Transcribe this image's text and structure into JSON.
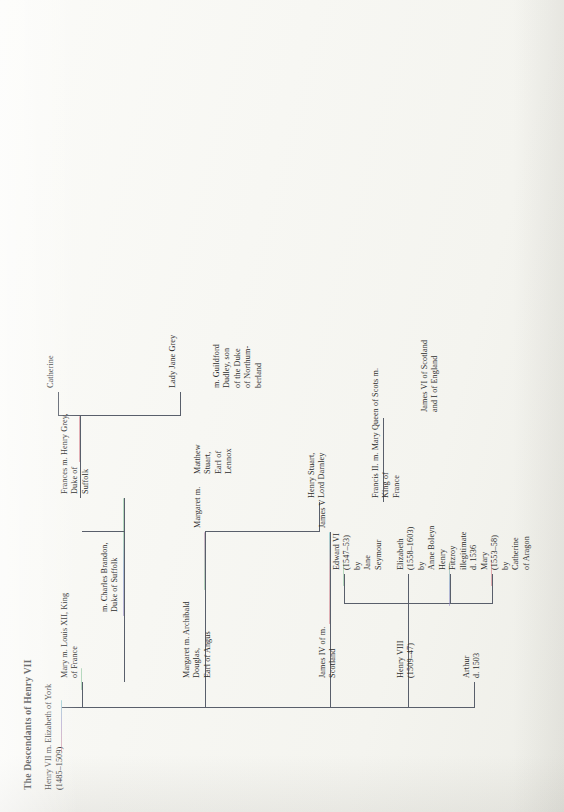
{
  "document": {
    "title": "The Descendants of Henry VII",
    "root": "Henry VII m. Elizabeth of York\n(1485–1509)"
  },
  "colors": {
    "ink": "#2c2c2c",
    "rule": "#595f6b",
    "paper": "#f6f6f1",
    "tint_red": "#d2737f",
    "tint_green": "#7fbf93",
    "tint_blue": "#6f8fc4",
    "tint_violet": "#8f7fbf"
  },
  "generations": [
    {
      "name": "children-of-henry-vii",
      "nodes": [
        {
          "id": "arthur",
          "text": "Arthur\nd. 1503"
        },
        {
          "id": "henry-viii",
          "text": "Henry VIII\n(1509–47)"
        },
        {
          "id": "james-iv",
          "text": "James IV of m.\nScotland"
        },
        {
          "id": "margaret-1",
          "text": "Margaret m.  Archibald\nDouglas,\nEarl of Angus"
        },
        {
          "id": "mary-tudor",
          "text": "Mary m.  Louis XII, King\nof France"
        }
      ]
    },
    {
      "name": "generation-3",
      "nodes": [
        {
          "id": "mary-i",
          "text": "Mary\n(1553–58)\nby\nCatherine\nof Aragon"
        },
        {
          "id": "henry-fitzroy",
          "text": "Henry\nFitzroy\nillegitimate\nd. 1536"
        },
        {
          "id": "elizabeth-i",
          "text": "Elizabeth\n(1558–1603)\nby\nAnne Boleyn"
        },
        {
          "id": "edward-vi",
          "text": "Edward VI\n(1547–53)\nby\nJane\nSeymour"
        },
        {
          "id": "james-v",
          "text": "James V"
        },
        {
          "id": "margaret-2",
          "text": "Margaret m."
        },
        {
          "id": "matthew-stuart",
          "text": "Matthew\nStuart,\nEarl of\nLennox"
        },
        {
          "id": "charles-brandon",
          "text": "m. Charles Brandon,\nDuke of Suffolk"
        }
      ]
    },
    {
      "name": "generation-4",
      "nodes": [
        {
          "id": "francis-ii",
          "text": "Francis II. m. Mary Queen of Scots m.\nKing of\nFrance"
        },
        {
          "id": "henry-darnley",
          "text": "Henry Stuart,\nLord Darnley"
        },
        {
          "id": "frances-grey",
          "text": "Frances m.  Henry Grey,\nDuke of\nSuffolk"
        }
      ]
    },
    {
      "name": "generation-5",
      "nodes": [
        {
          "id": "james-vi",
          "text": "James VI of Scotland\nand I of England"
        },
        {
          "id": "lady-jane-grey",
          "text": "Lady Jane Grey"
        },
        {
          "id": "guildford",
          "text": "m. Guildford\nDudley, son\nof the Duke\nof Northum-\nberland"
        },
        {
          "id": "catherine",
          "text": "Catherine"
        }
      ]
    }
  ],
  "labels": {
    "arthur": "Arthur\nd. 1503",
    "henry_viii": "Henry VIII\n(1509–47)",
    "james_iv": "James IV of m.\nScotland",
    "margaret_1": "Margaret m.  Archibald\nDouglas,\nEarl of Angus",
    "mary_tudor": "Mary m.  Louis XII, King\nof France",
    "charles_brandon": "m. Charles Brandon,\nDuke of Suffolk",
    "mary_i": "Mary\n(1553–58)\nby\nCatherine\nof Aragon",
    "henry_fitzroy": "Henry\nFitzroy\nillegitimate\nd. 1536",
    "elizabeth_i": "Elizabeth\n(1558–1603)\nby\nAnne Boleyn",
    "edward_vi": "Edward VI\n(1547–53)\nby\nJane\nSeymour",
    "james_v": "James V",
    "margaret_2": "Margaret m.",
    "matthew_stuart": "Matthew\nStuart,\nEarl of\nLennox",
    "frances_grey": "Frances m.  Henry Grey,\nDuke of\nSuffolk",
    "francis_ii": "Francis II. m. Mary Queen of Scots m.\nKing of\nFrance",
    "henry_darnley": "Henry Stuart,\nLord Darnley",
    "james_vi": "James VI of Scotland\nand I of England",
    "lady_jane_grey": "Lady Jane Grey",
    "guildford": "m. Guildford\nDudley, son\nof the Duke\nof Northum-\nberland",
    "catherine": "Catherine"
  }
}
